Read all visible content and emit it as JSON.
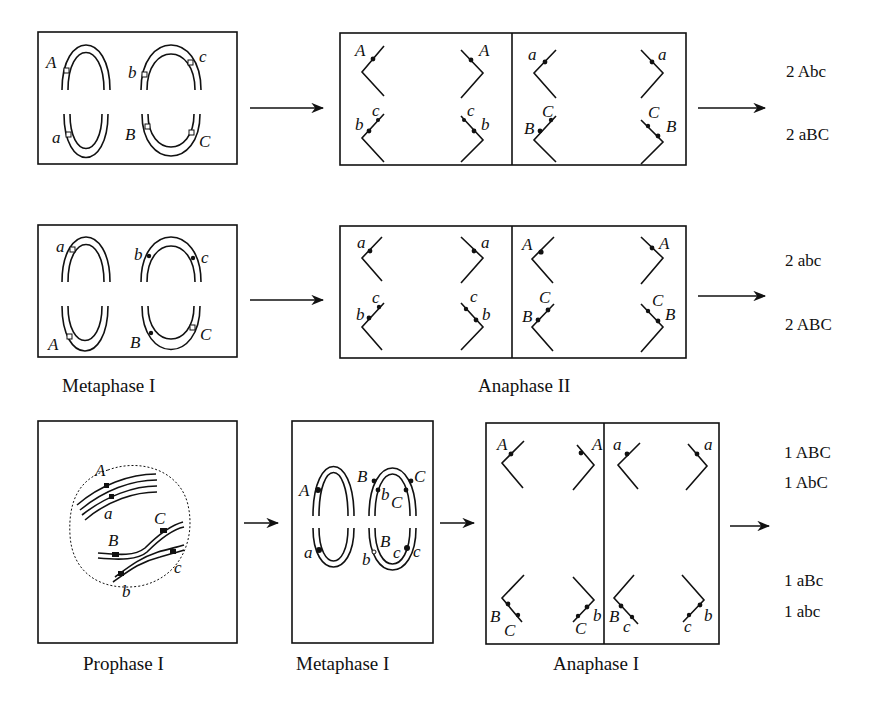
{
  "figure": {
    "rows": [
      {
        "id": "row-1",
        "metaphase_labels": {
          "top_left": "A",
          "top_right_left": "b",
          "top_right_right": "c",
          "bottom_left": "a",
          "bottom_right_left": "B",
          "bottom_right_right": "C"
        },
        "anaphase_left_cell": {
          "top_left": "A",
          "top_right": "A",
          "bottom_left_outer": "b",
          "bottom_left_inner": "c",
          "bottom_right_inner": "c",
          "bottom_right_outer": "b"
        },
        "anaphase_right_cell": {
          "top_left": "a",
          "top_right": "a",
          "bottom_left_outer": "B",
          "bottom_left_inner": "C",
          "bottom_right_inner": "C",
          "bottom_right_outer": "B"
        },
        "results": [
          "2 Abc",
          "2 aBC"
        ]
      },
      {
        "id": "row-2",
        "metaphase_labels": {
          "top_left": "a",
          "top_right_left": "b",
          "top_right_right": "c",
          "bottom_left": "A",
          "bottom_right_left": "B",
          "bottom_right_right": "C"
        },
        "anaphase_left_cell": {
          "top_left": "a",
          "top_right": "a",
          "bottom_left_outer": "b",
          "bottom_left_inner": "c",
          "bottom_right_inner": "c",
          "bottom_right_outer": "b"
        },
        "anaphase_right_cell": {
          "top_left": "A",
          "top_right": "A",
          "bottom_left_outer": "B",
          "bottom_left_inner": "C",
          "bottom_right_inner": "C",
          "bottom_right_outer": "B"
        },
        "results": [
          "2 abc",
          "2 ABC"
        ],
        "captions": {
          "metaphase": "Metaphase I",
          "anaphase": "Anaphase II"
        }
      },
      {
        "id": "row-3",
        "prophase_labels": {
          "A": "A",
          "a": "a",
          "B": "B",
          "C": "C",
          "b": "b",
          "c": "c"
        },
        "metaphase_labels": {
          "left_top": "A",
          "left_bottom": "a",
          "right_top_outer_left": "B",
          "right_top_outer_right": "C",
          "right_top_inner_left": "b",
          "right_top_inner_right": "C",
          "right_bottom_inner_left": "B",
          "right_bottom_inner_right": "c",
          "right_bottom_outer_left": "b",
          "right_bottom_outer_right": "c"
        },
        "anaphase_left_cell": {
          "top_left": "A",
          "top_right": "A",
          "bottom_left_outer": "B",
          "bottom_left_inner": "C",
          "bottom_right_inner": "C",
          "bottom_right_outer": "b"
        },
        "anaphase_right_cell": {
          "top_left": "a",
          "top_right": "a",
          "bottom_left_outer": "B",
          "bottom_left_inner": "c",
          "bottom_right_inner": "c",
          "bottom_right_outer": "b"
        },
        "results": [
          "1 ABC",
          "1 AbC",
          "1 aBc",
          "1 abc"
        ],
        "captions": {
          "prophase": "Prophase I",
          "metaphase": "Metaphase I",
          "anaphase": "Anaphase I"
        }
      }
    ]
  }
}
